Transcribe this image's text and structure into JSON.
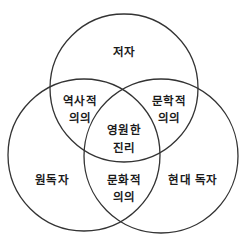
{
  "diagram": {
    "type": "venn",
    "stroke_color": "#333333",
    "text_color": "#1a1a1a",
    "background": "#ffffff",
    "circles": [
      {
        "name": "author",
        "cx": 124,
        "cy": 88,
        "r": 74
      },
      {
        "name": "original-reader",
        "cx": 84,
        "cy": 155,
        "r": 76
      },
      {
        "name": "modern-reader",
        "cx": 161,
        "cy": 156,
        "r": 77
      }
    ],
    "labels": {
      "author": "저자",
      "original_reader": "원독자",
      "modern_reader": "현대 독자",
      "historical_1": "역사적",
      "historical_2": "의의",
      "literary_1": "문학적",
      "literary_2": "의의",
      "cultural_1": "문화적",
      "cultural_2": "의의",
      "eternal_1": "영원한",
      "eternal_2": "진리"
    }
  }
}
